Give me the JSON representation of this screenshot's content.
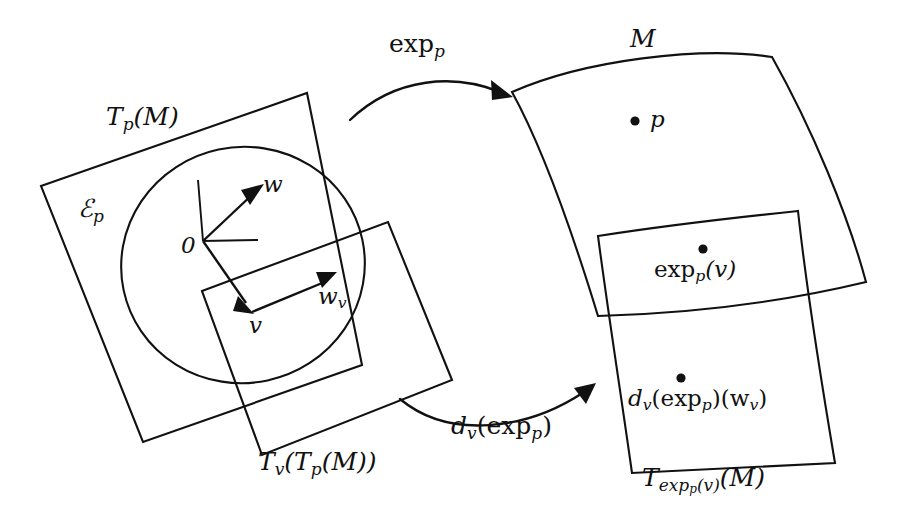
{
  "figure": {
    "kind": "differential-geometry-diagram",
    "background_color": "#ffffff",
    "ink_color": "#111111"
  },
  "labels": {
    "tangent_plane_p": "T_p(M)",
    "tangent_plane_p_parts": {
      "base": "T",
      "sub": "p",
      "arg": "(M)"
    },
    "epsilon_p": "ℰ_p",
    "epsilon_p_parts": {
      "base": "ℰ",
      "sub": "p"
    },
    "origin": "0",
    "vector_w": "w",
    "vector_v": "v",
    "vector_wv": "w_v",
    "vector_wv_parts": {
      "base": "w",
      "sub": "v"
    },
    "tangent_of_tangent": "T_v(T_p(M))",
    "tangent_of_tangent_parts": {
      "base": "T",
      "sub": "v",
      "mid": "(T",
      "sub2": "p",
      "tail": "(M))"
    },
    "manifold": "M",
    "point_p": "p",
    "exp_map": "exp_p",
    "exp_map_parts": {
      "base": "exp",
      "sub": "p"
    },
    "differential": "d_v(exp_p)",
    "differential_parts": {
      "base": "d",
      "sub": "v",
      "mid": "(exp",
      "sub2": "p",
      "tail": ")"
    },
    "image_point": "exp_p(v)",
    "image_point_parts": {
      "base": "exp",
      "sub": "p",
      "tail": "(v)"
    },
    "image_vector": "d_v(exp_p)(w_v)",
    "image_vector_parts": {
      "base": "d",
      "sub": "v",
      "mid": "(exp",
      "sub2": "p",
      "mid2": ")(w",
      "sub3": "v",
      "tail": ")"
    },
    "tangent_plane_exp": "T_exp_p(v)(M)",
    "tangent_plane_exp_parts": {
      "base": "T",
      "sub_exp": "exp",
      "sub_sub": "p",
      "sub_tail": "(v)",
      "tail": "(M)"
    }
  },
  "geometry": {
    "tangent_plane_p_corners": [
      [
        41,
        186
      ],
      [
        307,
        93
      ],
      [
        362,
        365
      ],
      [
        143,
        442
      ]
    ],
    "inner_tangent_rect_corners": [
      [
        202,
        291
      ],
      [
        388,
        222
      ],
      [
        452,
        380
      ],
      [
        262,
        455
      ]
    ],
    "ellipse": {
      "cx": 243,
      "cy": 265,
      "rx": 122,
      "ry": 118,
      "rotate": -12
    },
    "origin_point": [
      203,
      241
    ],
    "axis_vertical_end": [
      198,
      180
    ],
    "axis_horizontal_end": [
      258,
      240
    ],
    "arrow_w_tip": [
      262,
      186
    ],
    "arrow_v_tip": [
      252,
      312
    ],
    "arrow_wv_tip": [
      334,
      274
    ],
    "manifold_corners": [
      [
        512,
        92
      ],
      [
        772,
        57
      ],
      [
        866,
        282
      ],
      [
        598,
        316
      ]
    ],
    "manifold_tangent_corners": [
      [
        598,
        236
      ],
      [
        798,
        211
      ],
      [
        835,
        463
      ],
      [
        632,
        473
      ]
    ],
    "point_p": [
      635,
      121
    ],
    "point_exp_p_v": [
      703,
      249
    ],
    "point_dv_exp_p_wv": [
      681,
      378
    ],
    "exp_arrow": {
      "from": [
        350,
        120
      ],
      "to": [
        512,
        96
      ]
    },
    "dv_arrow": {
      "from": [
        400,
        399
      ],
      "to": [
        595,
        384
      ]
    }
  },
  "label_positions": {
    "tangent_plane_p": [
      106,
      104
    ],
    "epsilon_p": [
      78,
      196
    ],
    "origin": [
      181,
      234
    ],
    "vector_w": [
      263,
      173
    ],
    "vector_v": [
      249,
      314
    ],
    "vector_wv": [
      318,
      285
    ],
    "tangent_of_tangent": [
      258,
      449
    ],
    "manifold": [
      630,
      26
    ],
    "point_p": [
      650,
      108
    ],
    "exp_map": [
      389,
      31
    ],
    "differential": [
      451,
      413
    ],
    "image_point": [
      654,
      258
    ],
    "image_vector": [
      628,
      387
    ],
    "tangent_plane_exp": [
      642,
      465
    ]
  }
}
